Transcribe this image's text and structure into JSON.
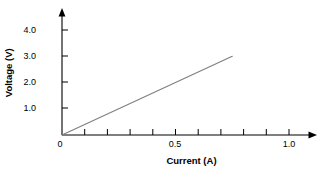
{
  "chart_data": {
    "type": "line",
    "title": "",
    "subtitle": "",
    "xlabel": "Current (A)",
    "ylabel": "Voltage (V)",
    "xlim": [
      0,
      1.1
    ],
    "ylim": [
      0,
      4.6
    ],
    "grid": false,
    "legend": null,
    "x_ticks_major": [
      0,
      0.5,
      1.0
    ],
    "x_tick_labels": [
      "0",
      "0.5",
      "1.0"
    ],
    "x_ticks_minor": [
      0.1,
      0.2,
      0.3,
      0.4,
      0.6,
      0.7,
      0.8,
      0.9
    ],
    "y_ticks_major": [
      1.0,
      2.0,
      3.0,
      4.0
    ],
    "y_tick_labels": [
      "1.0",
      "2.0",
      "3.0",
      "4.0"
    ],
    "origin_label": "0",
    "axes_style": "arrow-ended L-axes, no box, no gridlines",
    "series": [
      {
        "name": "Voltage vs Current",
        "color": "#808080",
        "line_width": 1.2,
        "markers": false,
        "x": [
          0,
          0.75
        ],
        "y": [
          0,
          3.0
        ],
        "slope": 4.0,
        "intercept": 0.0,
        "note": "straight line through origin, slope 4 V/A"
      }
    ],
    "annotations": []
  },
  "axis_labels": {
    "x_title": "Current (A)",
    "y_title": "Voltage (V)",
    "x0": "0",
    "x05": "0.5",
    "x10": "1.0",
    "y10": "1.0",
    "y20": "2.0",
    "y30": "3.0",
    "y40": "4.0"
  },
  "colors": {
    "background": "#ffffff",
    "axis": "#000000",
    "text": "#000000",
    "series_line": "#808080"
  }
}
